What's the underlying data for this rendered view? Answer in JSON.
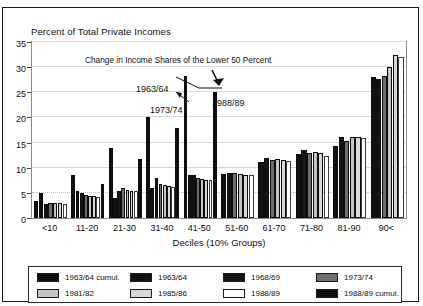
{
  "chart_title": "Percent of Total Private Incomes",
  "annotation_title": "Change in Income Shares of the Lower 50 Percent",
  "annotations": [
    {
      "label": "1963/64"
    },
    {
      "label": "1973/74"
    },
    {
      "label": "1988/89"
    }
  ],
  "xtitle": "Deciles (10% Groups)",
  "yticks": [
    "0",
    "5",
    "10",
    "15",
    "20",
    "25",
    "30",
    "35"
  ],
  "legend": [
    {
      "label": "1963/64 cumul.",
      "color": "#111111"
    },
    {
      "label": "1963/64",
      "color": "#111111"
    },
    {
      "label": "1968/69",
      "color": "#141414"
    },
    {
      "label": "1973/74",
      "color": "#6e6e6e"
    },
    {
      "label": "1981/82",
      "color": "#c4c4c4"
    },
    {
      "label": "1985/86",
      "color": "#d8d8d8"
    },
    {
      "label": "1988/89",
      "color": "#ffffff"
    },
    {
      "label": "1988/89 cumul.",
      "color": "#111111"
    }
  ],
  "chart_data": {
    "type": "bar",
    "title": "Percent of Total Private Incomes",
    "subtitle": "Change in Income Shares of the Lower 50 Percent",
    "xlabel": "Deciles (10% Groups)",
    "ylabel": "Percent of Total Private Incomes",
    "ylim": [
      0,
      35
    ],
    "ytick_step": 5,
    "grid": true,
    "legend_position": "bottom",
    "categories": [
      "<10",
      "11-20",
      "21-30",
      "31-40",
      "41-50",
      "51-60",
      "61-70",
      "71-80",
      "81-90",
      "90<"
    ],
    "series": [
      {
        "name": "1963/64 cumul.",
        "color": "#111111",
        "values": [
          3.3,
          8.5,
          14.0,
          20.0,
          28.2,
          0,
          0,
          0,
          0,
          0
        ]
      },
      {
        "name": "1963/64",
        "color": "#111111",
        "values": [
          5.0,
          5.4,
          4.0,
          6.0,
          8.6,
          8.8,
          11.1,
          12.8,
          14.3,
          28.0
        ]
      },
      {
        "name": "1968/69",
        "color": "#141414",
        "values": [
          2.7,
          5.0,
          5.4,
          8.0,
          8.6,
          8.9,
          11.9,
          13.5,
          16.2,
          27.6
        ]
      },
      {
        "name": "1973/74",
        "color": "#6e6e6e",
        "values": [
          2.9,
          4.5,
          5.9,
          6.8,
          7.9,
          9.0,
          11.6,
          12.9,
          15.3,
          28.3
        ]
      },
      {
        "name": "1981/82",
        "color": "#c4c4c4",
        "values": [
          2.9,
          4.3,
          5.5,
          6.6,
          7.7,
          8.8,
          11.8,
          13.1,
          16.2,
          30.0
        ]
      },
      {
        "name": "1985/86",
        "color": "#d8d8d8",
        "values": [
          2.9,
          4.3,
          5.4,
          6.3,
          7.6,
          8.6,
          11.6,
          13.0,
          16.1,
          32.5
        ]
      },
      {
        "name": "1988/89",
        "color": "#ffffff",
        "values": [
          2.7,
          4.2,
          5.4,
          6.2,
          7.6,
          8.5,
          11.4,
          12.4,
          16.0,
          32.0
        ]
      },
      {
        "name": "1988/89 cumul.",
        "color": "#111111",
        "values": [
          0,
          6.7,
          11.8,
          18.0,
          25.0,
          0,
          0,
          0,
          0,
          0
        ]
      }
    ]
  }
}
